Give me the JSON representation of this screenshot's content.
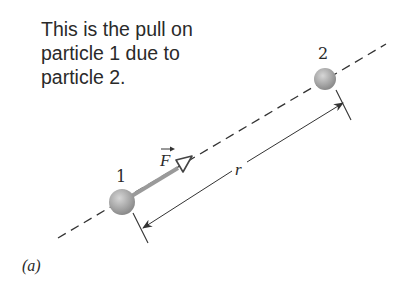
{
  "caption": {
    "lines": [
      "This is the pull on",
      "particle 1 due to",
      "particle 2."
    ]
  },
  "particles": [
    {
      "label": "1",
      "cx": 122,
      "cy": 202,
      "r": 13
    },
    {
      "label": "2",
      "cx": 325,
      "cy": 79,
      "r": 11
    }
  ],
  "force_vector": {
    "label": "F",
    "symbol": "vector-arrow"
  },
  "distance": {
    "label": "r"
  },
  "panel_label": "(a)",
  "colors": {
    "particle": "#a8a8a8",
    "force_arrow": "#9a9a9a",
    "lines": "#333333",
    "text": "#2a2a2a"
  }
}
